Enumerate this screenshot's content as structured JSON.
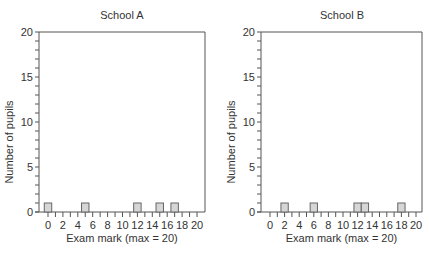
{
  "chart_data": [
    {
      "type": "bar",
      "title": "School A",
      "xlabel": "Exam mark (max = 20)",
      "ylabel": "Number of pupils",
      "xlim": [
        0,
        20
      ],
      "ylim": [
        0,
        20
      ],
      "x_ticks": [
        0,
        2,
        4,
        6,
        8,
        10,
        12,
        14,
        16,
        18,
        20
      ],
      "y_ticks": [
        0,
        5,
        10,
        15,
        20
      ],
      "grid": false,
      "bars": [
        {
          "x": 0,
          "value": 1
        },
        {
          "x": 5,
          "value": 1
        },
        {
          "x": 12,
          "value": 1
        },
        {
          "x": 15,
          "value": 1
        },
        {
          "x": 17,
          "value": 1
        }
      ]
    },
    {
      "type": "bar",
      "title": "School B",
      "xlabel": "Exam mark (max = 20)",
      "ylabel": "Number of pupils",
      "xlim": [
        0,
        20
      ],
      "ylim": [
        0,
        20
      ],
      "x_ticks": [
        0,
        2,
        4,
        6,
        8,
        10,
        12,
        14,
        16,
        18,
        20
      ],
      "y_ticks": [
        0,
        5,
        10,
        15,
        20
      ],
      "grid": false,
      "bars": [
        {
          "x": 2,
          "value": 1
        },
        {
          "x": 6,
          "value": 1
        },
        {
          "x": 12,
          "value": 1
        },
        {
          "x": 13,
          "value": 1
        },
        {
          "x": 18,
          "value": 1
        }
      ]
    }
  ],
  "colors": {
    "bar_fill": "#d6d6d6",
    "bar_stroke": "#666666",
    "axis": "#555555"
  }
}
